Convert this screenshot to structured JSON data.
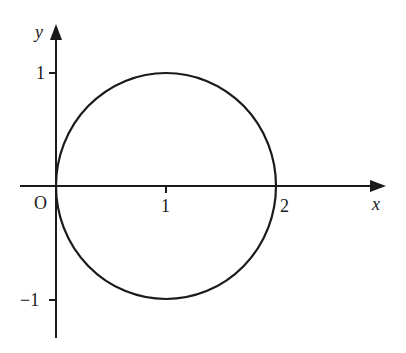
{
  "figure": {
    "type": "circle-on-axes",
    "axes": {
      "x_label": "x",
      "y_label": "y",
      "origin_label": "O"
    },
    "x_ticks": [
      {
        "value": 1,
        "label": "1"
      },
      {
        "value": 2,
        "label": "2"
      }
    ],
    "y_ticks": [
      {
        "value": 1,
        "label": "1"
      },
      {
        "value": -1,
        "label": "−1"
      }
    ],
    "curve": {
      "shape": "circle",
      "center": [
        1,
        0
      ],
      "radius": 1
    },
    "colors": {
      "stroke": "#1a1a1a",
      "background": "#ffffff"
    }
  }
}
